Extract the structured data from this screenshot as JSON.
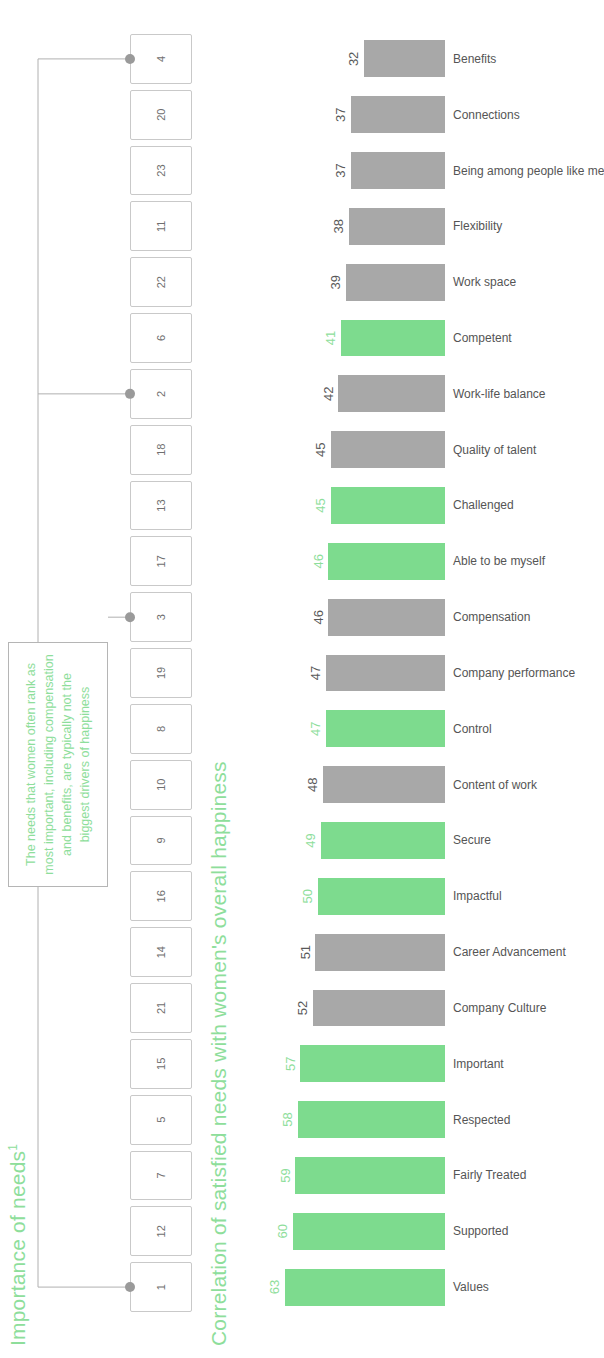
{
  "importance": {
    "title": "Importance of needs",
    "title_superscript": "1",
    "ranks": [
      "1",
      "12",
      "7",
      "5",
      "15",
      "21",
      "14",
      "16",
      "9",
      "10",
      "8",
      "19",
      "3",
      "17",
      "13",
      "18",
      "2",
      "6",
      "22",
      "11",
      "23",
      "20",
      "4"
    ],
    "marker_indices": [
      0,
      12,
      16,
      22
    ],
    "callout_text": "The needs that women often rank as most important, including compensation and benefits, are typically not the biggest drivers of happiness"
  },
  "correlation": {
    "title": "Correlation of satisfied needs with women's overall happiness"
  },
  "colors": {
    "green": "#7ddb8e",
    "green_text": "#8ede9b",
    "gray": "#a8a8a8",
    "gray_text": "#595959",
    "box_border": "#c9c9c9",
    "callout_border": "#b5b5b5",
    "marker": "#9a9a9a"
  },
  "chart_data": {
    "type": "bar",
    "title": "Correlation of satisfied needs with women's overall happiness",
    "xlabel": "",
    "ylabel": "",
    "ylim": [
      0,
      63
    ],
    "grid": false,
    "legend": null,
    "categories": [
      "Values",
      "Supported",
      "Fairly Treated",
      "Respected",
      "Important",
      "Company Culture",
      "Career Advancement",
      "Impactful",
      "Secure",
      "Content of work",
      "Control",
      "Company performance",
      "Compensation",
      "Able to be myself",
      "Challenged",
      "Quality of talent",
      "Work-life balance",
      "Competent",
      "Work space",
      "Flexibility",
      "Being among people like me",
      "Connections",
      "Benefits"
    ],
    "values": [
      63,
      60,
      59,
      58,
      57,
      52,
      51,
      50,
      49,
      48,
      47,
      47,
      46,
      46,
      45,
      45,
      42,
      41,
      39,
      38,
      37,
      37,
      32
    ],
    "bar_colors": [
      "green",
      "green",
      "green",
      "green",
      "green",
      "gray",
      "gray",
      "green",
      "green",
      "gray",
      "green",
      "gray",
      "gray",
      "green",
      "green",
      "gray",
      "gray",
      "green",
      "gray",
      "gray",
      "gray",
      "gray",
      "gray"
    ],
    "importance_ranks": [
      1,
      12,
      7,
      5,
      15,
      21,
      14,
      16,
      9,
      10,
      8,
      19,
      3,
      17,
      13,
      18,
      2,
      6,
      22,
      11,
      23,
      20,
      4
    ]
  }
}
